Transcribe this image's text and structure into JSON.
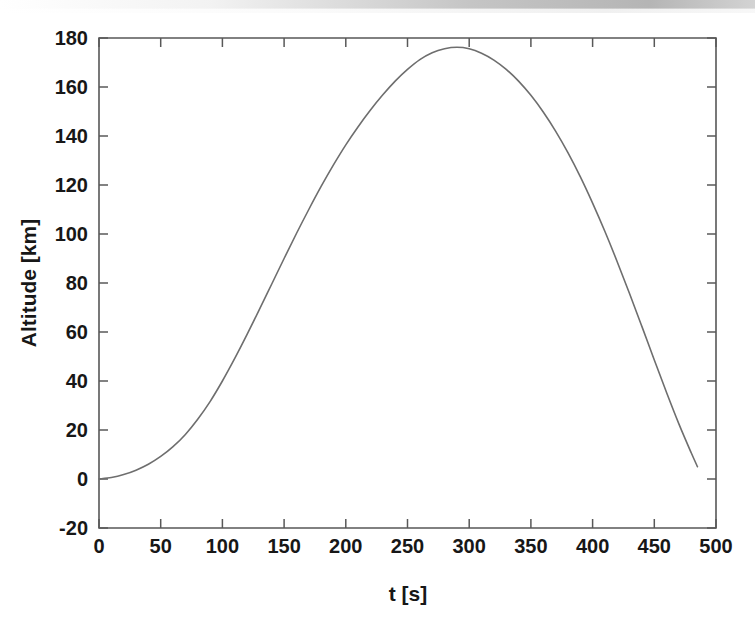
{
  "figure": {
    "name": "altitude-vs-time-plot",
    "background_color": "#ffffff",
    "axis_color": "#585858",
    "curve_color": "#6e6e6e",
    "scan_artifact_top": true
  },
  "chart_data": {
    "type": "line",
    "title": "",
    "xlabel": "t [s]",
    "ylabel": "Altitude [km]",
    "xlim": [
      0,
      500
    ],
    "ylim": [
      -20,
      180
    ],
    "xticks": [
      0,
      50,
      100,
      150,
      200,
      250,
      300,
      350,
      400,
      450,
      500
    ],
    "xtick_labels": [
      "0",
      "50",
      "100",
      "150",
      "200",
      "250",
      "300",
      "350",
      "400",
      "450",
      "500"
    ],
    "yticks": [
      -20,
      0,
      20,
      40,
      60,
      80,
      100,
      120,
      140,
      160,
      180
    ],
    "ytick_labels": [
      "-20",
      "0",
      "20",
      "40",
      "60",
      "80",
      "100",
      "120",
      "140",
      "160",
      "180"
    ],
    "grid": false,
    "legend": false,
    "box": true,
    "tick_direction": "in",
    "series": [
      {
        "name": "Altitude",
        "x": [
          0,
          10,
          20,
          30,
          40,
          50,
          60,
          70,
          80,
          90,
          100,
          110,
          120,
          130,
          140,
          150,
          160,
          170,
          180,
          190,
          200,
          210,
          220,
          230,
          240,
          250,
          260,
          270,
          280,
          290,
          300,
          310,
          320,
          330,
          340,
          350,
          360,
          370,
          380,
          390,
          400,
          410,
          420,
          430,
          440,
          450,
          460,
          470,
          480,
          485
        ],
        "y": [
          0,
          0.6,
          1.8,
          3.6,
          6.0,
          9.2,
          13.2,
          18.2,
          24.4,
          31.6,
          40.0,
          49.2,
          59.0,
          69.2,
          79.6,
          90.0,
          100.2,
          110.0,
          119.4,
          128.2,
          136.4,
          143.8,
          150.6,
          156.8,
          162.4,
          167.2,
          171.2,
          174.0,
          175.6,
          176.2,
          175.6,
          173.8,
          171.0,
          167.2,
          162.4,
          156.6,
          149.8,
          142.0,
          133.2,
          123.4,
          112.6,
          101.0,
          88.6,
          75.6,
          62.2,
          48.6,
          35.2,
          22.4,
          10.6,
          5.0
        ]
      }
    ],
    "annotations": {
      "peak_value": 176.2,
      "peak_time": 290,
      "start_point": [
        0,
        0
      ],
      "end_point": [
        485,
        -3
      ]
    }
  },
  "axes": {
    "x_axis_label": "t [s]",
    "y_axis_label": "Altitude [km]"
  }
}
